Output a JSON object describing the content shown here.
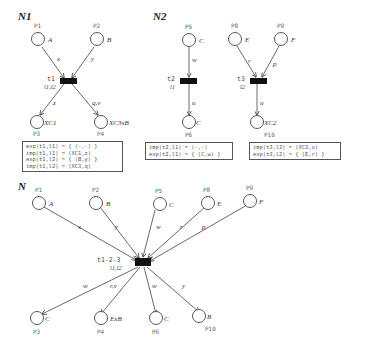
{
  "nets": {
    "n1": {
      "title": "N1",
      "places": [
        {
          "id": "P1",
          "color": "A"
        },
        {
          "id": "P2",
          "color": "B"
        },
        {
          "id": "P3",
          "color": "XC1"
        },
        {
          "id": "P4",
          "color": "XC3xB"
        }
      ],
      "transition": {
        "name": "t1",
        "labels": "l1,l2"
      },
      "arcs": [
        "x",
        "y",
        "z",
        "q,v"
      ],
      "box": [
        "exp(t1,l1) = { (-,-) }",
        "imp(t1,l1) = (XC1,z)",
        "exp(t1,l2) = { (B,y) }",
        "imp(t1,l2) = (XC3,q)"
      ]
    },
    "n2": {
      "title": "N2",
      "places": [
        {
          "id": "P5",
          "color": "C"
        },
        {
          "id": "P6",
          "color": "C"
        },
        {
          "id": "P8",
          "color": "E"
        },
        {
          "id": "P9",
          "color": "F"
        },
        {
          "id": "P10",
          "color": "XC2"
        }
      ],
      "transitions": [
        {
          "name": "t2",
          "labels": "l1"
        },
        {
          "name": "t3",
          "labels": "l2"
        }
      ],
      "arcs": [
        "w",
        "u",
        "r",
        "p",
        "u"
      ],
      "box_t2": [
        "imp(t2,l1) = (-,-)",
        "exp(t2,l1) = { (C,w) }"
      ],
      "box_t3": [
        "imp(t3,l2) = (XC2,u)",
        "exp(t3,l2) = { (E,r) }"
      ]
    },
    "n": {
      "title": "N",
      "places": [
        {
          "id": "P1",
          "color": "A"
        },
        {
          "id": "P2",
          "color": "B"
        },
        {
          "id": "P5",
          "color": "C"
        },
        {
          "id": "P8",
          "color": "E"
        },
        {
          "id": "P9",
          "color": "F"
        },
        {
          "id": "P3",
          "color": "C"
        },
        {
          "id": "P4",
          "color": "ExB"
        },
        {
          "id": "P6",
          "color": "C"
        },
        {
          "id": "P10",
          "color": "B"
        }
      ],
      "transition": {
        "name": "t1-2-3",
        "labels": "l1,l2"
      },
      "arcs_in": [
        "x",
        "y",
        "w",
        "r",
        "p"
      ],
      "arcs_out": [
        "w",
        "r,v",
        "w",
        "y"
      ]
    }
  }
}
